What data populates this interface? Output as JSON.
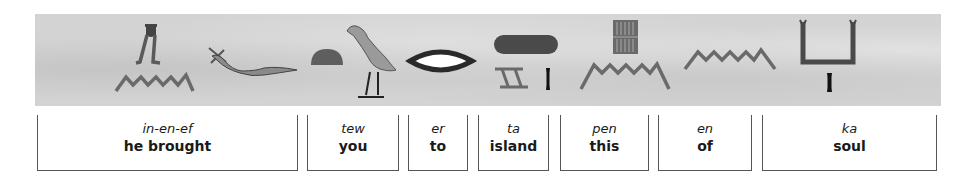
{
  "colors": {
    "papyrus": "#d3d3d3",
    "glyph_gray": "#6a6a6a",
    "glyph_dark": "#4a4a4a",
    "glyph_black": "#111111",
    "bracket_line": "#555555",
    "text": "#1a1a1a"
  },
  "glyph_row": {
    "glyphs": [
      {
        "name": "pot-on-legs-hieroglyph"
      },
      {
        "name": "water-ripple-hieroglyph"
      },
      {
        "name": "horned-viper-hieroglyph"
      },
      {
        "name": "bread-loaf-hieroglyph"
      },
      {
        "name": "quail-chick-hieroglyph"
      },
      {
        "name": "mouth-hieroglyph"
      },
      {
        "name": "sand-strip-hieroglyph"
      },
      {
        "name": "stool-hieroglyph"
      },
      {
        "name": "stroke-determinative-hieroglyph"
      },
      {
        "name": "reed-mat-hieroglyph"
      },
      {
        "name": "water-ripple-hieroglyph"
      },
      {
        "name": "water-ripple-hieroglyph"
      },
      {
        "name": "raised-arms-hieroglyph"
      },
      {
        "name": "stroke-determinative-hieroglyph"
      }
    ]
  },
  "words": [
    {
      "translit": "in-en-ef",
      "english": "he brought"
    },
    {
      "translit": "tew",
      "english": "you"
    },
    {
      "translit": "er",
      "english": "to"
    },
    {
      "translit": "ta",
      "english": "island"
    },
    {
      "translit": "pen",
      "english": "this"
    },
    {
      "translit": "en",
      "english": "of"
    },
    {
      "translit": "ka",
      "english": "soul"
    }
  ]
}
